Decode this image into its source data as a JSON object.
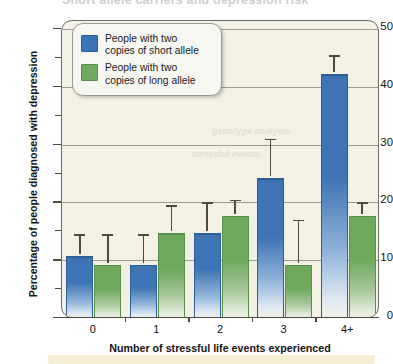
{
  "figure": {
    "ghost_title": "Short allele carriers and depression risk",
    "bleed_text_1": "genotype analysis",
    "bleed_text_2": "stressful events"
  },
  "chart_data": {
    "type": "bar",
    "title": "",
    "xlabel": "Number of stressful life events experienced",
    "ylabel": "Percentage of people diagnosed with depression",
    "categories": [
      "0",
      "1",
      "2",
      "3",
      "4+"
    ],
    "ylim": [
      0,
      50
    ],
    "ytick_labels": [
      "0",
      "10",
      "20",
      "30",
      "40",
      "50"
    ],
    "ytick_values": [
      0,
      10,
      20,
      30,
      40,
      50
    ],
    "yminor_values": [
      5,
      15,
      25,
      35,
      45
    ],
    "grid": true,
    "grid_axis": "y",
    "legend_position": "upper left",
    "series": [
      {
        "name": "People with two copies of short allele",
        "color": "#3a74b8",
        "values": [
          11,
          9.5,
          15,
          24.5,
          42.5
        ],
        "error_high": [
          14.5,
          14.5,
          20,
          31,
          45.5
        ],
        "error_low": [
          7.5,
          5.5,
          10.5,
          18,
          39.5
        ]
      },
      {
        "name": "People with two copies of long allele",
        "color": "#6faa5e",
        "values": [
          9.5,
          15,
          18,
          9.5,
          18
        ],
        "error_high": [
          14.5,
          19.5,
          20.5,
          17,
          20
        ],
        "error_low": [
          5.5,
          11,
          15.5,
          3,
          16
        ]
      }
    ]
  },
  "legend": {
    "items": [
      {
        "label_line1": "People with two",
        "label_line2": "copies of short allele",
        "color": "#3a74b8"
      },
      {
        "label_line1": "People with two",
        "label_line2": "copies of long allele",
        "color": "#6faa5e"
      }
    ]
  }
}
